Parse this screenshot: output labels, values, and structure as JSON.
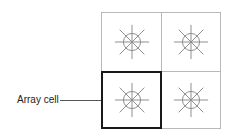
{
  "diagram": {
    "grid": {
      "rows": 2,
      "cols": 2,
      "cells": [
        {
          "row": 0,
          "col": 0,
          "icon": "light-burst-icon",
          "highlighted": false
        },
        {
          "row": 0,
          "col": 1,
          "icon": "light-burst-icon",
          "highlighted": false
        },
        {
          "row": 1,
          "col": 0,
          "icon": "light-burst-icon",
          "highlighted": true
        },
        {
          "row": 1,
          "col": 1,
          "icon": "light-burst-icon",
          "highlighted": false
        }
      ]
    },
    "callout": {
      "label": "Array cell",
      "target": "row 1, col 0"
    },
    "colors": {
      "grid_line": "#b8b8b8",
      "highlight_border": "#1a1a1a",
      "icon_stroke": "#888888",
      "label_text": "#222222"
    }
  }
}
